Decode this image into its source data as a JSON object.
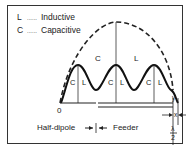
{
  "legend": {
    "items": [
      {
        "key": "L",
        "dots": "......",
        "label": "Inductive"
      },
      {
        "key": "C",
        "dots": "......",
        "label": "Capacitive"
      }
    ]
  },
  "diagram": {
    "envelope_labels": {
      "left": "C",
      "right": "L"
    },
    "wave_labels": [
      "C",
      "L",
      "C",
      "L",
      "C",
      "L"
    ],
    "origin_label": "0",
    "axis_labels": {
      "half_dipole": "Half-dipole",
      "feeder": "Feeder"
    },
    "dimension_labels": {
      "x": "x",
      "y": "y",
      "lambda_num": "λ",
      "lambda_den": "2"
    }
  },
  "colors": {
    "line": "#222222",
    "background": "#ffffff"
  }
}
